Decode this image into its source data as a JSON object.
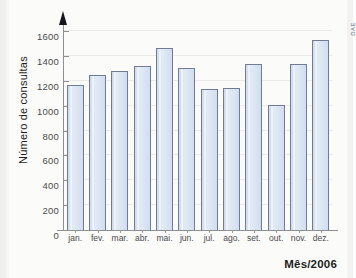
{
  "figure": {
    "credit": "DAE",
    "background_color": "#fbfbfa",
    "bar_fill_color": "#d8e3f2",
    "bar_border_color": "#6f7c93",
    "axis_color": "#8d8f92",
    "gridline_color": "#eceae4"
  },
  "chart_data": {
    "type": "bar",
    "title": "",
    "xlabel": "Mês/2006",
    "ylabel": "Número de consultas",
    "categories": [
      "jan.",
      "fev.",
      "mar.",
      "abr.",
      "mai.",
      "jun.",
      "jul.",
      "ago.",
      "set.",
      "out.",
      "nov.",
      "dez."
    ],
    "values": [
      1165,
      1250,
      1280,
      1320,
      1465,
      1300,
      1130,
      1145,
      1335,
      1005,
      1335,
      1530
    ],
    "ylim": [
      0,
      1600
    ],
    "yticks": [
      0,
      200,
      400,
      600,
      800,
      1000,
      1200,
      1400,
      1600
    ],
    "ytick_labels": [
      "0",
      "200",
      "400",
      "600",
      "800",
      "1000",
      "1200",
      "1400",
      "1600"
    ],
    "grid": true,
    "grid_axis": "y",
    "legend": false,
    "legend_position": "none",
    "series": [
      {
        "name": "Número de consultas",
        "values": [
          1165,
          1250,
          1280,
          1320,
          1465,
          1300,
          1130,
          1145,
          1335,
          1005,
          1335,
          1530
        ]
      }
    ]
  }
}
